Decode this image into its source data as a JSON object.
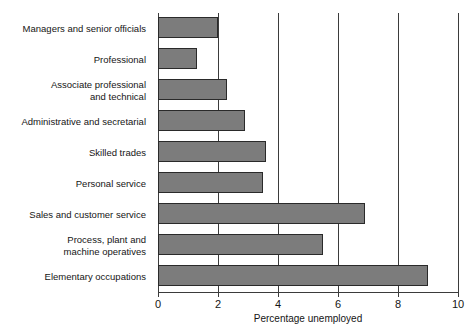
{
  "chart_data": {
    "type": "bar",
    "orientation": "horizontal",
    "title": "",
    "xlabel": "Percentage unemployed",
    "ylabel": "",
    "xlim": [
      0,
      10
    ],
    "xticks": [
      0,
      2,
      4,
      6,
      8,
      10
    ],
    "xtick_labels": [
      "0",
      "2",
      "4",
      "6",
      "8",
      "10"
    ],
    "grid": true,
    "grid_axis": "x",
    "legend": false,
    "bar_color": "#7c7c7c",
    "bar_edge_color": "#2a2a2a",
    "axis_color": "#3b3b3b",
    "categories": [
      "Managers and senior officials",
      "Professional",
      "Associate professional and technical",
      "Administrative and secretarial",
      "Skilled trades",
      "Personal service",
      "Sales and customer service",
      "Process, plant and machine operatives",
      "Elementary occupations"
    ],
    "category_lines": [
      [
        "Managers and senior officials"
      ],
      [
        "Professional"
      ],
      [
        "Associate professional",
        "and technical"
      ],
      [
        "Administrative and secretarial"
      ],
      [
        "Skilled trades"
      ],
      [
        "Personal service"
      ],
      [
        "Sales and customer service"
      ],
      [
        "Process, plant and",
        "machine operatives"
      ],
      [
        "Elementary occupations"
      ]
    ],
    "values": [
      2.0,
      1.3,
      2.3,
      2.9,
      3.6,
      3.5,
      6.9,
      5.5,
      9.0
    ]
  }
}
